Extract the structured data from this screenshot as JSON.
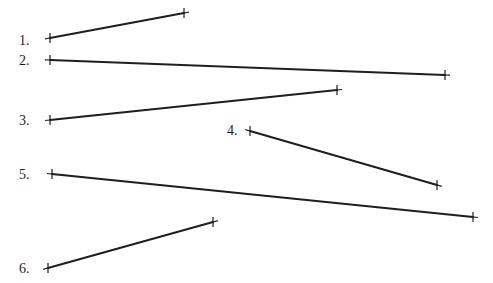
{
  "diagram": {
    "title": "",
    "line_color": "#1e1e1e",
    "segments": [
      {
        "label": "1.",
        "label_pos": [
          19,
          34
        ],
        "x1": 50,
        "y1": 38,
        "x2": 184,
        "y2": 13
      },
      {
        "label": "2.",
        "label_pos": [
          19,
          54
        ],
        "x1": 50,
        "y1": 60,
        "x2": 445,
        "y2": 75
      },
      {
        "label": "3.",
        "label_pos": [
          19,
          114
        ],
        "x1": 50,
        "y1": 120,
        "x2": 337,
        "y2": 90
      },
      {
        "label": "4.",
        "label_pos": [
          227,
          124
        ],
        "x1": 250,
        "y1": 131,
        "x2": 437,
        "y2": 185
      },
      {
        "label": "5.",
        "label_pos": [
          19,
          168
        ],
        "x1": 52,
        "y1": 174,
        "x2": 473,
        "y2": 217
      },
      {
        "label": "6.",
        "label_pos": [
          19,
          262
        ],
        "x1": 48,
        "y1": 268,
        "x2": 213,
        "y2": 222
      }
    ]
  }
}
